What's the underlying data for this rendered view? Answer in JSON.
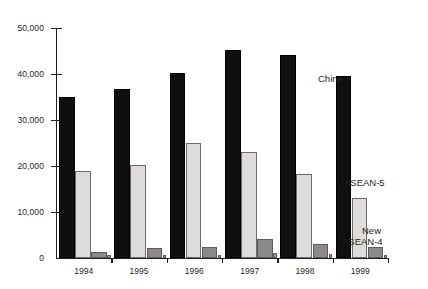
{
  "chart_data": {
    "type": "bar",
    "title": "",
    "xlabel": "",
    "ylabel": "",
    "categories": [
      "1994",
      "1995",
      "1996",
      "1997",
      "1998",
      "1999"
    ],
    "ylim": [
      0,
      50000
    ],
    "yticks": [
      0,
      10000,
      20000,
      30000,
      40000,
      50000
    ],
    "ytick_labels": [
      "0",
      "10,000",
      "20,000",
      "30,000",
      "40,000",
      "50,000"
    ],
    "grid": false,
    "legend_position": "right-inline",
    "series": [
      {
        "name": "China",
        "color": "#100f10",
        "values": [
          35000,
          36800,
          40300,
          45300,
          44200,
          39500
        ]
      },
      {
        "name": "ASEAN-5",
        "color": "#dddcda",
        "values": [
          18900,
          20300,
          25100,
          23100,
          18200,
          13000
        ]
      },
      {
        "name": "New ASEAN-4",
        "color": "#8b8a88",
        "values": [
          1300,
          2200,
          2300,
          4100,
          3100,
          2500
        ]
      },
      {
        "name": "",
        "color": "#9a9997",
        "values": [
          700,
          700,
          700,
          1100,
          900,
          700
        ]
      }
    ],
    "annotations": [
      {
        "text": "China",
        "series": "China"
      },
      {
        "text": "ASEAN-5",
        "series": "ASEAN-5"
      },
      {
        "text": "New\nASEAN-4",
        "series": "New ASEAN-4"
      }
    ]
  },
  "labels": {
    "china": "China",
    "asean5": "ASEAN-5",
    "new_asean4_line1": "New",
    "new_asean4_line2": "ASEAN-4"
  }
}
